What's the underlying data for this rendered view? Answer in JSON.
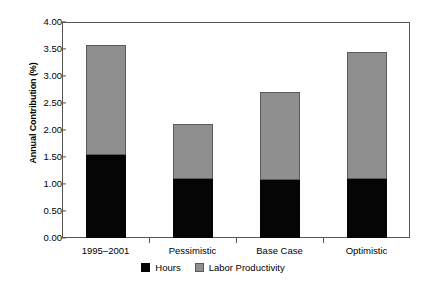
{
  "chart_data": {
    "type": "bar",
    "stacked": true,
    "title": "",
    "xlabel": "",
    "ylabel": "Annual Contribution (%)",
    "categories": [
      "1995–2001",
      "Pessimistic",
      "Base Case",
      "Optimistic"
    ],
    "series": [
      {
        "name": "Hours",
        "color": "#050505",
        "values": [
          1.53,
          1.09,
          1.08,
          1.09
        ]
      },
      {
        "name": "Labor Productivity",
        "color": "#8f8f8f",
        "values": [
          2.05,
          1.02,
          1.63,
          2.36
        ]
      }
    ],
    "totals": [
      3.58,
      2.11,
      2.71,
      3.45
    ],
    "ylim": [
      0.0,
      4.0
    ],
    "ytick_step": 0.5,
    "ytick_labels": [
      "0.00",
      "0.50",
      "1.00",
      "1.50",
      "2.00",
      "2.50",
      "3.00",
      "3.50",
      "4.00"
    ],
    "ytick_values": [
      0.0,
      0.5,
      1.0,
      1.5,
      2.0,
      2.5,
      3.0,
      3.5,
      4.0
    ],
    "grid": false,
    "legend_position": "bottom-center",
    "legend_entries": [
      "Hours",
      "Labor Productivity"
    ],
    "frame_color": "#555555",
    "background_color": "#ffffff"
  }
}
